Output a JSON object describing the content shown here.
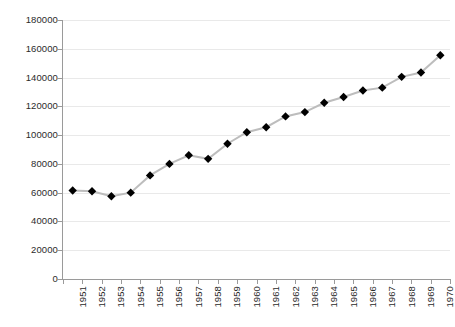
{
  "chart_data": {
    "type": "line",
    "title": "",
    "xlabel": "",
    "ylabel": "",
    "categories": [
      "1951",
      "1952",
      "1953",
      "1954",
      "1955",
      "1956",
      "1957",
      "1958",
      "1959",
      "1960",
      "1961",
      "1962",
      "1963",
      "1964",
      "1965",
      "1966",
      "1967",
      "1968",
      "1969",
      "1970"
    ],
    "values": [
      61500,
      61000,
      57500,
      60000,
      72000,
      80000,
      86000,
      83500,
      94000,
      102000,
      105500,
      113000,
      116000,
      122500,
      126500,
      131000,
      133000,
      140500,
      143500,
      155500
    ],
    "series": [
      {
        "name": "series-1",
        "values": [
          61500,
          61000,
          57500,
          60000,
          72000,
          80000,
          86000,
          83500,
          94000,
          102000,
          105500,
          113000,
          116000,
          122500,
          126500,
          131000,
          133000,
          140500,
          143500,
          155500
        ]
      }
    ],
    "ylim": [
      0,
      180000
    ],
    "ytick_step": 20000,
    "y_ticks": [
      "0",
      "20000",
      "40000",
      "60000",
      "80000",
      "100000",
      "120000",
      "140000",
      "160000",
      "180000"
    ],
    "y_tick_values": [
      0,
      20000,
      40000,
      60000,
      80000,
      100000,
      120000,
      140000,
      160000,
      180000
    ],
    "grid": true,
    "grid_axis": "y",
    "legend": false,
    "legend_position": "none",
    "marker": "diamond",
    "marker_color": "#000000",
    "line_color": "#bdbdbd",
    "grid_color": "#e9e9e9",
    "axis_color": "#9a9a9a",
    "background_color": "#ffffff",
    "annotations": []
  }
}
